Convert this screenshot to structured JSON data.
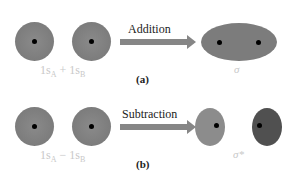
{
  "panel_a": {
    "label": "(a)",
    "operation": "Addition",
    "left_term": "1s",
    "left_sub": "A",
    "operator": "+",
    "right_term": "1s",
    "right_sub": "B",
    "result": "σ"
  },
  "panel_b": {
    "label": "(b)",
    "operation": "Subtraction",
    "left_term": "1s",
    "left_sub": "A",
    "operator": "−",
    "right_term": "1s",
    "right_sub": "B",
    "result": "σ*"
  },
  "colors": {
    "orbital": "#7c7c7c",
    "orbital_dark": "#505050",
    "orbital_light": "#8c8c8c",
    "arrow": "#868686",
    "nucleus": "#000000",
    "label": "#c8c8c8"
  }
}
